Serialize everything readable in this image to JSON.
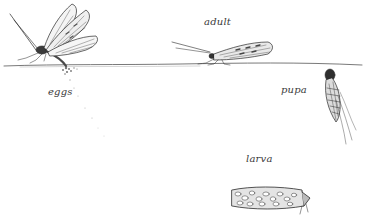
{
  "illustration": {
    "subject": "caddisfly life cycle",
    "colors": {
      "background": "#ffffff",
      "ink": "#2a2a2a",
      "water_line": "#6a6a6a",
      "label": "#3a3a3a"
    },
    "stages": [
      {
        "id": "eggs",
        "label": "eggs"
      },
      {
        "id": "adult",
        "label": "adult"
      },
      {
        "id": "pupa",
        "label": "pupa"
      },
      {
        "id": "larva",
        "label": "larva"
      }
    ]
  }
}
